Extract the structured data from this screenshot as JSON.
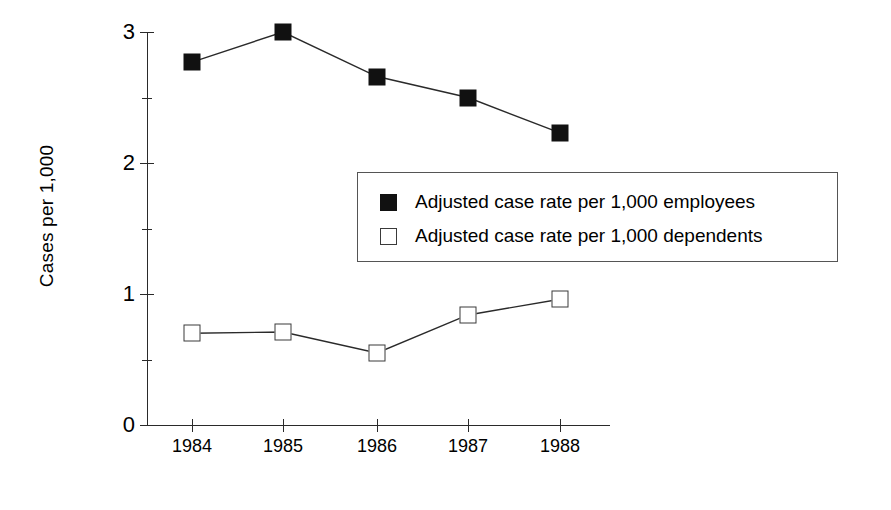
{
  "chart_data": {
    "type": "line",
    "title": "",
    "xlabel": "",
    "ylabel": "Cases per 1,000",
    "categories": [
      "1984",
      "1985",
      "1986",
      "1987",
      "1988"
    ],
    "ylim": [
      0,
      3
    ],
    "y_ticks_major": [
      "0",
      "1",
      "2",
      "3"
    ],
    "y_minor_ticks": [
      0.5,
      1.5,
      2.5
    ],
    "grid": false,
    "legend_position": "inside-right",
    "series": [
      {
        "name": "Adjusted case rate per 1,000 employees",
        "marker": "filled-square",
        "color": "#111111",
        "values": [
          2.77,
          3.0,
          2.66,
          2.5,
          2.23
        ]
      },
      {
        "name": "Adjusted case rate per 1,000 dependents",
        "marker": "open-square",
        "color": "#ffffff",
        "values": [
          0.7,
          0.71,
          0.55,
          0.84,
          0.96
        ]
      }
    ]
  },
  "axes": {
    "y_title": "Cases per 1,000",
    "y_tick_labels": [
      "3",
      "2",
      "1",
      "0"
    ],
    "x_tick_labels": [
      "1984",
      "1985",
      "1986",
      "1987",
      "1988"
    ]
  },
  "legend": {
    "entries": [
      {
        "swatch": "filled-square",
        "label": "Adjusted case rate per 1,000 employees"
      },
      {
        "swatch": "open-square",
        "label": "Adjusted case rate per 1,000 dependents"
      }
    ]
  }
}
